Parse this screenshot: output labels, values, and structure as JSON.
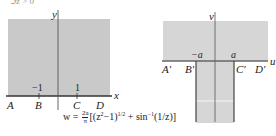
{
  "top_cropped_text": "ℑz > 0",
  "z_plane": {
    "x_axis_label": "x",
    "y_axis_label": "y",
    "tick_labels": [
      "−1",
      "1"
    ],
    "point_labels": [
      "A",
      "B",
      "C",
      "D"
    ],
    "fill_color": "#c9c9c9",
    "axis_color": "#333333"
  },
  "w_plane": {
    "u_axis_label": "u",
    "v_axis_label": "v",
    "tick_labels": [
      "−a",
      "a"
    ],
    "point_labels": [
      "A′",
      "B′",
      "C′",
      "D′"
    ],
    "fill_color": "#d6d6d6",
    "axis_color": "#555555"
  },
  "formula": {
    "lhs": "w =",
    "frac_num": "2a",
    "frac_den": "π",
    "rhs": "[(z²−1)^{1/2} + sin⁻¹(1/z)]",
    "part1": "[(z",
    "sup2": "2",
    "part2": "−1)",
    "sup_half": "1/2",
    "part3": " + sin",
    "sup_inv": "−1",
    "part4": "(1/z)]"
  }
}
